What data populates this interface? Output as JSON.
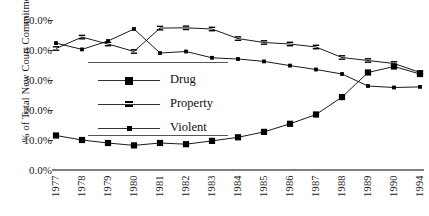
{
  "chart_data": {
    "type": "line",
    "title": "",
    "xlabel": "",
    "ylabel": "% of  Total New Court Commitments",
    "ylim": [
      0,
      50
    ],
    "ytick_labels": [
      "50.0%",
      "40.0%",
      "30.0%",
      "20.0%",
      "10.0%",
      "0.0%"
    ],
    "ytick_values": [
      50,
      40,
      30,
      20,
      10,
      0
    ],
    "grid": false,
    "legend_position": "inside-left",
    "categories": [
      "1977",
      "1978",
      "1979",
      "1980",
      "1981",
      "1982",
      "1983",
      "1984",
      "1985",
      "1986",
      "1987",
      "1988",
      "1989",
      "1990",
      "1994"
    ],
    "series": [
      {
        "name": "Drug",
        "marker": "filled-square",
        "line": "solid",
        "color": "#000000",
        "values": [
          11.5,
          10.0,
          9.0,
          8.2,
          9.0,
          8.6,
          9.7,
          10.9,
          12.7,
          15.4,
          18.5,
          24.3,
          32.5,
          34.5,
          32.0
        ]
      },
      {
        "name": "Property",
        "marker": "dashed-square",
        "line": "solid",
        "color": "#000000",
        "values": [
          40.5,
          44.3,
          42.0,
          39.5,
          47.3,
          47.4,
          47.0,
          43.8,
          42.5,
          42.0,
          41.0,
          37.5,
          36.5,
          35.5,
          32.5
        ]
      },
      {
        "name": "Violent",
        "marker": "small-square",
        "line": "solid",
        "color": "#000000",
        "values": [
          42.3,
          40.2,
          43.0,
          47.0,
          39.0,
          39.5,
          37.4,
          37.0,
          36.2,
          34.8,
          33.5,
          32.0,
          28.0,
          27.5,
          27.7
        ]
      }
    ]
  },
  "legend": {
    "items": [
      {
        "label": "Drug"
      },
      {
        "label": "Property"
      },
      {
        "label": "Violent"
      }
    ]
  }
}
